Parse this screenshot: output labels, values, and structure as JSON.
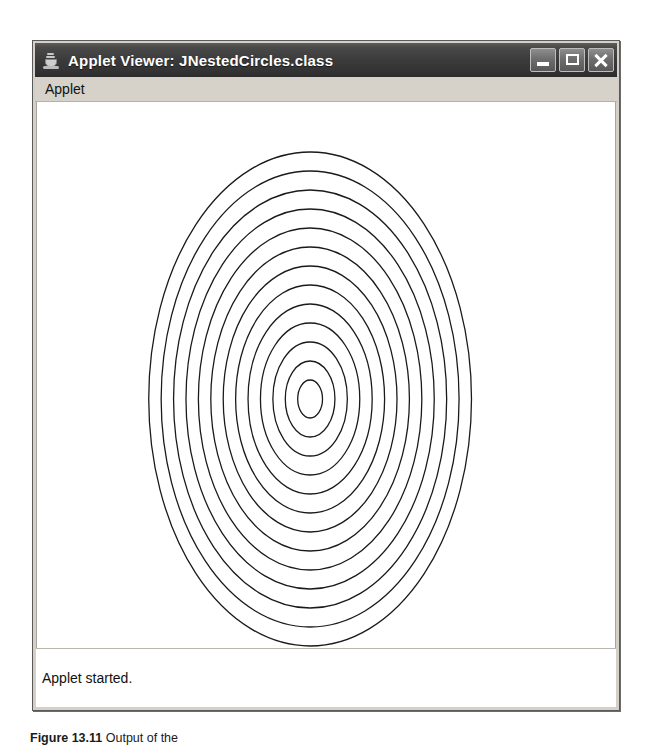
{
  "window": {
    "title": "Applet Viewer: JNestedCircles.class",
    "icon": "java-coffee-cup-icon",
    "controls": [
      {
        "name": "minimize-button",
        "label": "_"
      },
      {
        "name": "maximize-button",
        "label": "□"
      },
      {
        "name": "close-button",
        "label": "✕"
      }
    ]
  },
  "menubar": {
    "items": [
      {
        "label": "Applet"
      }
    ]
  },
  "canvas": {
    "background_color": "#ffffff",
    "stroke_color": "#1a1a1a"
  },
  "statusbar": {
    "text": "Applet started."
  },
  "caption": {
    "figure_label": "Figure 13.11",
    "text": "Output of the"
  },
  "chart_data": {
    "type": "scatter",
    "xlabel": "",
    "ylabel": "",
    "center_x": 310,
    "center_y": 398,
    "count": 13,
    "radius_step_x": 12.5,
    "radius_step_y": 19.0,
    "radii_x": [
      12.5,
      25,
      37.5,
      50,
      62.5,
      75,
      87.5,
      100,
      112.5,
      125,
      137.5,
      150,
      162.5
    ],
    "radii_y": [
      19,
      38,
      57,
      76,
      95,
      114,
      133,
      152,
      171,
      190,
      209,
      228,
      247
    ],
    "grid": false,
    "legend": "none"
  }
}
